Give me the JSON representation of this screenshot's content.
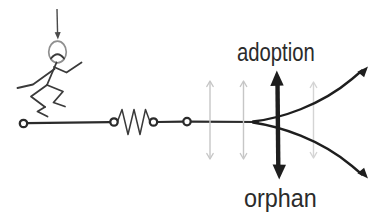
{
  "window": {
    "width": 391,
    "height": 213,
    "background": "#ffffff"
  },
  "diagram": {
    "type": "bifurcation-sketch",
    "labels": {
      "upper_branch": "adoption",
      "lower_branch": "orphan"
    },
    "colors": {
      "ink": "#2b2b2b",
      "figure_stroke": "#3a3a3a",
      "head_outline": "#8f8f8f",
      "fluctuation_gray": "#c6c6c6",
      "fluctuation_gray_light": "#d4d4d4"
    },
    "icons": [
      "down-arrow-icon",
      "running-person-icon",
      "resistor-icon",
      "node-circle-icon",
      "double-headed-arrow-icon",
      "fluctuation-arrow-icon",
      "branch-arrow-icon"
    ]
  }
}
